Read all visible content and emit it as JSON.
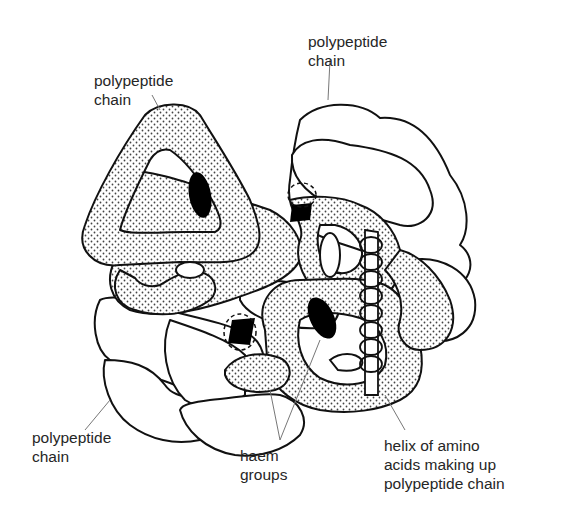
{
  "diagram": {
    "labels": {
      "top_left": {
        "lines": [
          "polypeptide",
          "chain"
        ]
      },
      "top_right": {
        "lines": [
          "polypeptide",
          "chain"
        ]
      },
      "bottom_left": {
        "lines": [
          "polypeptide",
          "chain"
        ]
      },
      "bottom_center": {
        "lines": [
          "haem",
          "groups"
        ]
      },
      "bottom_right": {
        "lines": [
          "helix of amino",
          "acids making up",
          "polypeptide chain"
        ]
      }
    },
    "colors": {
      "outline": "#111111",
      "stipple_fill": "#f4f4f4",
      "stipple_dot": "#444444",
      "haem": "#000000",
      "leader_line": "#777777",
      "background": "#ffffff"
    }
  }
}
